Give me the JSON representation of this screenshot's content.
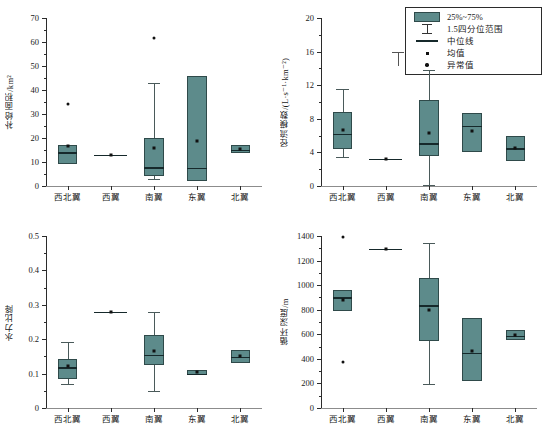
{
  "legend": {
    "title": "",
    "items": [
      {
        "key": "box",
        "label": "25%~75%"
      },
      {
        "key": "whisker",
        "label": "1.5四分位范围"
      },
      {
        "key": "median",
        "label": "中位线"
      },
      {
        "key": "mean",
        "label": "均值"
      },
      {
        "key": "outlier",
        "label": "异常值"
      }
    ]
  },
  "colors": {
    "box_fill": "#5d8b8b",
    "box_edge": "#2f4a4a",
    "median": "#16292b",
    "marker": "#111111",
    "axis": "#2b2b2b",
    "background": "#ffffff"
  },
  "categories": [
    "西北翼",
    "西翼",
    "南翼",
    "东翼",
    "北翼"
  ],
  "chart_data": [
    {
      "id": "recharge-area",
      "type": "box",
      "title": "",
      "xlabel": "",
      "ylabel": "补给面积/km²",
      "ylim": [
        0,
        70
      ],
      "yticks": [
        0,
        10,
        20,
        30,
        40,
        50,
        60,
        70
      ],
      "ytick_labels": [
        "0",
        "10",
        "20",
        "30",
        "40",
        "50",
        "60",
        "70"
      ],
      "grid": false,
      "categories": [
        "西北翼",
        "西翼",
        "南翼",
        "东翼",
        "北翼"
      ],
      "boxes": [
        {
          "category": "西北翼",
          "whisker_low": 9.0,
          "q1": 9.0,
          "median": 14.0,
          "q3": 17.0,
          "whisker_high": 17.0,
          "mean": 16.5,
          "outliers": [
            34.0
          ]
        },
        {
          "category": "西翼",
          "whisker_low": 13.0,
          "q1": 13.0,
          "median": 13.0,
          "q3": 13.0,
          "whisker_high": 13.0,
          "mean": 13.0,
          "outliers": []
        },
        {
          "category": "南翼",
          "whisker_low": 3.0,
          "q1": 4.2,
          "median": 7.8,
          "q3": 20.2,
          "whisker_high": 43.0,
          "mean": 16.0,
          "outliers": [
            61.5
          ]
        },
        {
          "category": "东翼",
          "whisker_low": 2.2,
          "q1": 2.2,
          "median": 7.5,
          "q3": 46.0,
          "whisker_high": 46.0,
          "mean": 18.8,
          "outliers": []
        },
        {
          "category": "北翼",
          "whisker_low": 13.8,
          "q1": 13.8,
          "median": 15.2,
          "q3": 17.0,
          "whisker_high": 17.0,
          "mean": 15.3,
          "outliers": []
        }
      ]
    },
    {
      "id": "runoff-modulus",
      "type": "box",
      "title": "",
      "xlabel": "",
      "ylabel": "径流模数/(L·s⁻¹·km⁻²)",
      "ylim": [
        0,
        20
      ],
      "yticks": [
        0,
        4,
        8,
        12,
        16,
        20
      ],
      "ytick_labels": [
        "0",
        "4",
        "8",
        "12",
        "16",
        "20"
      ],
      "grid": false,
      "categories": [
        "西北翼",
        "西翼",
        "南翼",
        "东翼",
        "北翼"
      ],
      "boxes": [
        {
          "category": "西北翼",
          "whisker_low": 3.5,
          "q1": 4.4,
          "median": 6.2,
          "q3": 8.8,
          "whisker_high": 11.6,
          "mean": 6.7,
          "outliers": []
        },
        {
          "category": "西翼",
          "whisker_low": 3.2,
          "q1": 3.2,
          "median": 3.2,
          "q3": 3.2,
          "whisker_high": 3.2,
          "mean": 3.2,
          "outliers": []
        },
        {
          "category": "南翼",
          "whisker_low": 0.1,
          "q1": 3.6,
          "median": 5.1,
          "q3": 10.2,
          "whisker_high": 13.8,
          "mean": 6.3,
          "outliers": []
        },
        {
          "category": "东翼",
          "whisker_low": 4.0,
          "q1": 4.0,
          "median": 7.2,
          "q3": 8.7,
          "whisker_high": 8.7,
          "mean": 6.6,
          "outliers": []
        },
        {
          "category": "北翼",
          "whisker_low": 3.0,
          "q1": 3.0,
          "median": 4.5,
          "q3": 6.0,
          "whisker_high": 6.0,
          "mean": 4.5,
          "outliers": []
        }
      ]
    },
    {
      "id": "hydraulic-gradient",
      "type": "box",
      "title": "",
      "xlabel": "",
      "ylabel": "水力比降",
      "ylim": [
        0,
        0.5
      ],
      "yticks": [
        0,
        0.1,
        0.2,
        0.3,
        0.4,
        0.5
      ],
      "ytick_labels": [
        "0",
        "0.1",
        "0.2",
        "0.3",
        "0.4",
        "0.5"
      ],
      "grid": false,
      "categories": [
        "西北翼",
        "西翼",
        "南翼",
        "东翼",
        "北翼"
      ],
      "boxes": [
        {
          "category": "西北翼",
          "whisker_low": 0.071,
          "q1": 0.083,
          "median": 0.118,
          "q3": 0.143,
          "whisker_high": 0.192,
          "mean": 0.121,
          "outliers": []
        },
        {
          "category": "西翼",
          "whisker_low": 0.279,
          "q1": 0.279,
          "median": 0.279,
          "q3": 0.279,
          "whisker_high": 0.279,
          "mean": 0.279,
          "outliers": []
        },
        {
          "category": "南翼",
          "whisker_low": 0.05,
          "q1": 0.124,
          "median": 0.154,
          "q3": 0.211,
          "whisker_high": 0.279,
          "mean": 0.165,
          "outliers": []
        },
        {
          "category": "东翼",
          "whisker_low": 0.096,
          "q1": 0.096,
          "median": 0.099,
          "q3": 0.11,
          "whisker_high": 0.11,
          "mean": 0.104,
          "outliers": []
        },
        {
          "category": "北翼",
          "whisker_low": 0.132,
          "q1": 0.132,
          "median": 0.148,
          "q3": 0.17,
          "whisker_high": 0.17,
          "mean": 0.152,
          "outliers": []
        }
      ]
    },
    {
      "id": "circulation-depth",
      "type": "box",
      "title": "",
      "xlabel": "",
      "ylabel": "循环深度/m",
      "ylim": [
        0,
        1400
      ],
      "yticks": [
        0,
        200,
        400,
        600,
        800,
        1000,
        1200,
        1400
      ],
      "ytick_labels": [
        "0",
        "200",
        "400",
        "600",
        "800",
        "1000",
        "1200",
        "1400"
      ],
      "grid": false,
      "categories": [
        "西北翼",
        "西翼",
        "南翼",
        "东翼",
        "北翼"
      ],
      "boxes": [
        {
          "category": "西北翼",
          "whisker_low": 790,
          "q1": 790,
          "median": 900,
          "q3": 960,
          "whisker_high": 960,
          "mean": 880,
          "outliers": [
            1390,
            372
          ]
        },
        {
          "category": "西翼",
          "whisker_low": 1295,
          "q1": 1295,
          "median": 1295,
          "q3": 1295,
          "whisker_high": 1295,
          "mean": 1295,
          "outliers": []
        },
        {
          "category": "南翼",
          "whisker_low": 192,
          "q1": 548,
          "median": 835,
          "q3": 1055,
          "whisker_high": 1340,
          "mean": 798,
          "outliers": []
        },
        {
          "category": "东翼",
          "whisker_low": 218,
          "q1": 218,
          "median": 450,
          "q3": 730,
          "whisker_high": 730,
          "mean": 466,
          "outliers": []
        },
        {
          "category": "北翼",
          "whisker_low": 552,
          "q1": 552,
          "median": 588,
          "q3": 638,
          "whisker_high": 638,
          "mean": 594,
          "outliers": []
        }
      ]
    }
  ]
}
